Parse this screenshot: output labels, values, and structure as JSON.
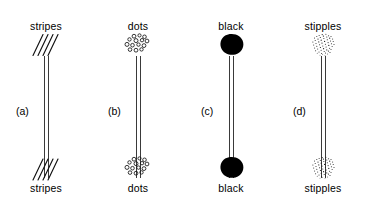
{
  "figure": {
    "background_color": "#ffffff",
    "ink_color": "#000000",
    "stem_color": "#3a3a3a",
    "panel_count": 4
  },
  "panels": [
    {
      "letter": "(a)",
      "pattern_name": "stripes",
      "label_top": "stripes",
      "label_bottom": "stripes",
      "icon_name": "stripes-pattern-icon",
      "marks": 4
    },
    {
      "letter": "(b)",
      "pattern_name": "dots",
      "label_top": "dots",
      "label_bottom": "dots",
      "icon_name": "dots-pattern-icon",
      "marks": 14
    },
    {
      "letter": "(c)",
      "pattern_name": "black",
      "label_top": "black",
      "label_bottom": "black",
      "icon_name": "black-blob-icon",
      "marks": 1
    },
    {
      "letter": "(d)",
      "pattern_name": "stipples",
      "label_top": "stipples",
      "label_bottom": "stipples",
      "icon_name": "stipples-pattern-icon",
      "marks": 120
    }
  ]
}
